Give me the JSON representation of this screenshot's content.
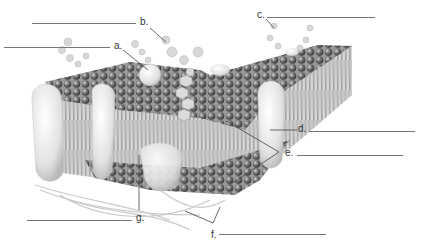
{
  "diagram": {
    "labels": [
      {
        "letter": "a.",
        "answer_blank": ""
      },
      {
        "letter": "b.",
        "answer_blank": ""
      },
      {
        "letter": "c.",
        "answer_blank": ""
      },
      {
        "letter": "d.",
        "answer_blank": ""
      },
      {
        "letter": "e.",
        "answer_blank": ""
      },
      {
        "letter": "f.",
        "answer_blank": ""
      },
      {
        "letter": "g.",
        "answer_blank": ""
      }
    ]
  },
  "colors": {
    "background": "#ffffff",
    "label_text": "#333333",
    "leader_line": "#444444",
    "blank_line": "#777777",
    "phospholipid_head": "#6a6a6a",
    "protein": "#e6e6e6"
  }
}
